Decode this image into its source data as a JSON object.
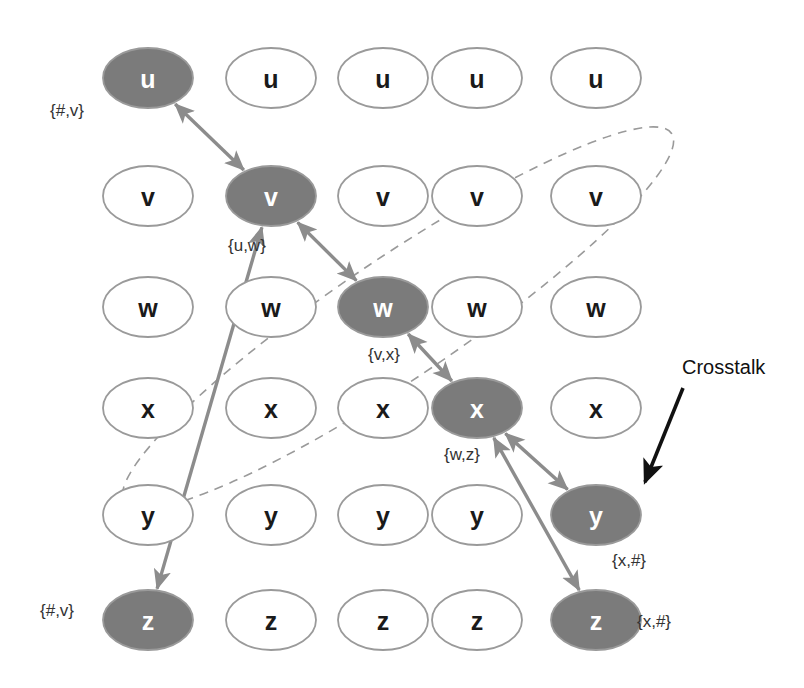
{
  "diagram": {
    "colors": {
      "node_fill_active": "#7b7b7b",
      "node_fill_inactive": "#ffffff",
      "node_stroke": "#9a9a9a",
      "node_text_active": "#ffffff",
      "node_text_inactive": "#1a1a1a",
      "arrow": "#8c8c8c",
      "dashed_ellipse": "#9a9a9a",
      "annotation_arrow": "#111111",
      "background": "#ffffff"
    },
    "grid": {
      "row_labels": [
        "u",
        "v",
        "w",
        "x",
        "y",
        "z"
      ],
      "column_count": 5,
      "column_centers": [
        148,
        271,
        383,
        477,
        596
      ],
      "row_centers": [
        78,
        196,
        307,
        408,
        515,
        620
      ],
      "ellipse_rx": 45,
      "ellipse_ry": 30
    },
    "nodes": [
      {
        "id": "u1",
        "label": "u",
        "row": 0,
        "col": 0,
        "active": true
      },
      {
        "id": "u2",
        "label": "u",
        "row": 0,
        "col": 1,
        "active": false
      },
      {
        "id": "u3",
        "label": "u",
        "row": 0,
        "col": 2,
        "active": false
      },
      {
        "id": "u4",
        "label": "u",
        "row": 0,
        "col": 3,
        "active": false
      },
      {
        "id": "u5",
        "label": "u",
        "row": 0,
        "col": 4,
        "active": false
      },
      {
        "id": "v1",
        "label": "v",
        "row": 1,
        "col": 0,
        "active": false
      },
      {
        "id": "v2",
        "label": "v",
        "row": 1,
        "col": 1,
        "active": true
      },
      {
        "id": "v3",
        "label": "v",
        "row": 1,
        "col": 2,
        "active": false
      },
      {
        "id": "v4",
        "label": "v",
        "row": 1,
        "col": 3,
        "active": false
      },
      {
        "id": "v5",
        "label": "v",
        "row": 1,
        "col": 4,
        "active": false
      },
      {
        "id": "w1",
        "label": "w",
        "row": 2,
        "col": 0,
        "active": false
      },
      {
        "id": "w2",
        "label": "w",
        "row": 2,
        "col": 1,
        "active": false
      },
      {
        "id": "w3",
        "label": "w",
        "row": 2,
        "col": 2,
        "active": true
      },
      {
        "id": "w4",
        "label": "w",
        "row": 2,
        "col": 3,
        "active": false
      },
      {
        "id": "w5",
        "label": "w",
        "row": 2,
        "col": 4,
        "active": false
      },
      {
        "id": "x1",
        "label": "x",
        "row": 3,
        "col": 0,
        "active": false
      },
      {
        "id": "x2",
        "label": "x",
        "row": 3,
        "col": 1,
        "active": false
      },
      {
        "id": "x3",
        "label": "x",
        "row": 3,
        "col": 2,
        "active": false
      },
      {
        "id": "x4",
        "label": "x",
        "row": 3,
        "col": 3,
        "active": true
      },
      {
        "id": "x5",
        "label": "x",
        "row": 3,
        "col": 4,
        "active": false
      },
      {
        "id": "y1",
        "label": "y",
        "row": 4,
        "col": 0,
        "active": false
      },
      {
        "id": "y2",
        "label": "y",
        "row": 4,
        "col": 1,
        "active": false
      },
      {
        "id": "y3",
        "label": "y",
        "row": 4,
        "col": 2,
        "active": false
      },
      {
        "id": "y4",
        "label": "y",
        "row": 4,
        "col": 3,
        "active": false
      },
      {
        "id": "y5",
        "label": "y",
        "row": 4,
        "col": 4,
        "active": true
      },
      {
        "id": "z1",
        "label": "z",
        "row": 5,
        "col": 0,
        "active": true
      },
      {
        "id": "z2",
        "label": "z",
        "row": 5,
        "col": 1,
        "active": false
      },
      {
        "id": "z3",
        "label": "z",
        "row": 5,
        "col": 2,
        "active": false
      },
      {
        "id": "z4",
        "label": "z",
        "row": 5,
        "col": 3,
        "active": false
      },
      {
        "id": "z5",
        "label": "z",
        "row": 5,
        "col": 4,
        "active": true
      }
    ],
    "edges": [
      {
        "id": "edge-u1-v2",
        "from": "u1",
        "to": "v2",
        "double": true
      },
      {
        "id": "edge-v2-w3",
        "from": "v2",
        "to": "w3",
        "double": true
      },
      {
        "id": "edge-w3-x4",
        "from": "w3",
        "to": "x4",
        "double": true
      },
      {
        "id": "edge-x4-y5",
        "from": "x4",
        "to": "y5",
        "double": true
      },
      {
        "id": "edge-x4-z5",
        "from": "x4",
        "to": "z5",
        "double": true
      },
      {
        "id": "edge-v2-z1",
        "from": "v2",
        "to": "z1",
        "double": true
      }
    ],
    "set_labels": [
      {
        "id": "set-hash-v-top",
        "text": "{#,v}",
        "x": 50,
        "y": 101
      },
      {
        "id": "set-u-w",
        "text": "{u,w}",
        "x": 228,
        "y": 236
      },
      {
        "id": "set-v-x",
        "text": "{v,x}",
        "x": 368,
        "y": 345
      },
      {
        "id": "set-w-z",
        "text": "{w,z}",
        "x": 444,
        "y": 445
      },
      {
        "id": "set-x-hash-mid",
        "text": "{x,#}",
        "x": 612,
        "y": 551
      },
      {
        "id": "set-hash-v-bot",
        "text": "{#,v}",
        "x": 40,
        "y": 601
      },
      {
        "id": "set-x-hash-bot",
        "text": "{x,#}",
        "x": 637,
        "y": 612
      }
    ],
    "annotation": {
      "label": "Crosstalk",
      "label_x": 682,
      "label_y": 356,
      "arrow_from": {
        "x": 683,
        "y": 388
      },
      "arrow_to": {
        "x": 645,
        "y": 482
      }
    },
    "crosstalk_ellipse": {
      "id": "crosstalk-ellipse",
      "cx": 398,
      "cy": 318,
      "rx": 60,
      "ry": 330,
      "rotation_deg": 56,
      "dash": "9 7"
    }
  }
}
